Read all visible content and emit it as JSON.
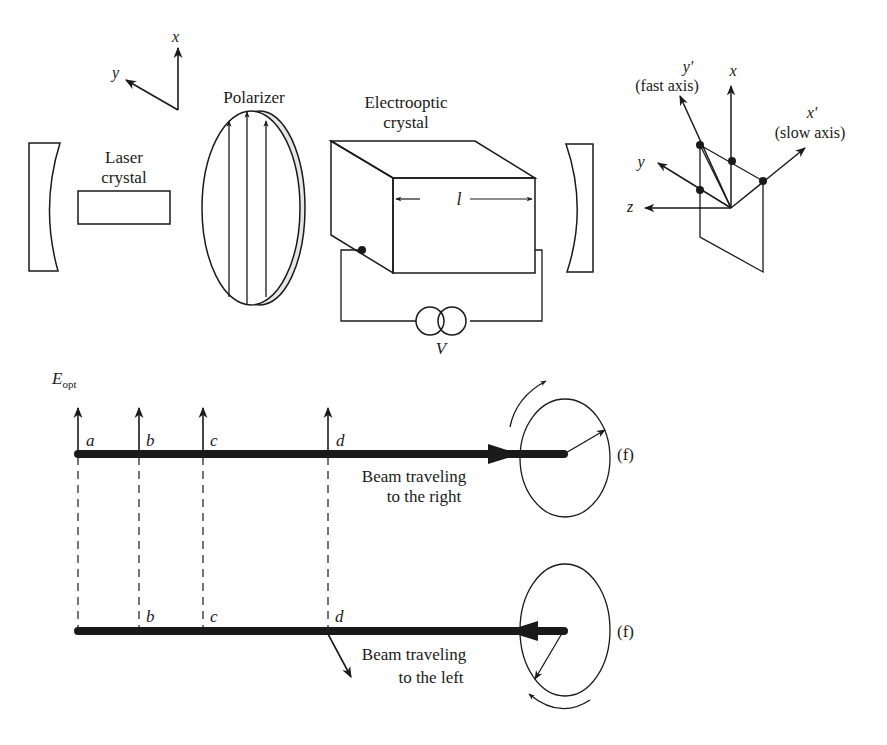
{
  "figure": {
    "top_panel": {
      "axes_left": {
        "x_label": "x",
        "y_label": "y"
      },
      "laser_crystal": {
        "label_line1": "Laser",
        "label_line2": "crystal"
      },
      "polarizer": {
        "label": "Polarizer"
      },
      "electrooptic_crystal": {
        "label_line1": "Electrooptic",
        "label_line2": "crystal",
        "length_label": "l",
        "voltage_label": "V"
      },
      "axes_right": {
        "y_prime_label": "y'",
        "fast_axis_label": "(fast axis)",
        "x_label": "x",
        "x_prime_label": "x'",
        "slow_axis_label": "(slow axis)",
        "y_label": "y",
        "z_label": "z"
      }
    },
    "bottom_panel": {
      "field_label_main": "E",
      "field_label_sub": "opt",
      "right_beam": {
        "points": [
          "a",
          "b",
          "c",
          "d"
        ],
        "caption_line1": "Beam traveling",
        "caption_line2": "to the right",
        "end_label": "(f)"
      },
      "left_beam": {
        "points": [
          "b",
          "c",
          "d"
        ],
        "caption_line1": "Beam traveling",
        "caption_line2": "to the left",
        "end_label": "(f)"
      }
    }
  }
}
